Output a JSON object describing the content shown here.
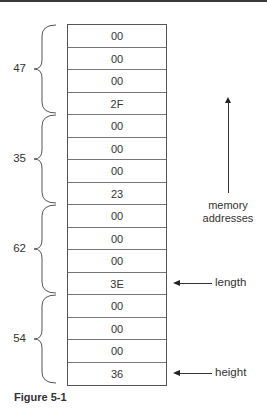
{
  "figure": {
    "caption": "Figure 5-1",
    "cells": [
      "00",
      "00",
      "00",
      "2F",
      "00",
      "00",
      "00",
      "23",
      "00",
      "00",
      "00",
      "3E",
      "00",
      "00",
      "00",
      "36"
    ],
    "groups": [
      {
        "label": "47",
        "start_row": 0,
        "end_row": 3
      },
      {
        "label": "35",
        "start_row": 4,
        "end_row": 7
      },
      {
        "label": "62",
        "start_row": 8,
        "end_row": 11
      },
      {
        "label": "54",
        "start_row": 12,
        "end_row": 15
      }
    ],
    "axis_label_line1": "memory",
    "axis_label_line2": "addresses",
    "pointers": [
      {
        "label": "length",
        "row": 11
      },
      {
        "label": "height",
        "row": 15
      }
    ]
  }
}
